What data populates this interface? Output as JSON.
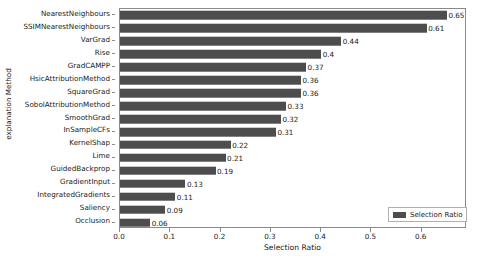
{
  "chart_data": {
    "type": "bar",
    "orientation": "horizontal",
    "title": "",
    "xlabel": "Selection Ratio",
    "ylabel": "explanation Method",
    "xlim": [
      0.0,
      0.69
    ],
    "xticks": [
      0.0,
      0.1,
      0.2,
      0.3,
      0.4,
      0.5,
      0.6
    ],
    "xtick_labels": [
      "0.0",
      "0.1",
      "0.2",
      "0.3",
      "0.4",
      "0.5",
      "0.6"
    ],
    "grid": false,
    "legend": {
      "position": "lower right",
      "entries": [
        "Selection Ratio"
      ]
    },
    "bar_color": "#4d4d4d",
    "categories": [
      "NearestNeighbours",
      "SSIMNearestNeighbours",
      "VarGrad",
      "Rise",
      "GradCAMPP",
      "HsicAttributionMethod",
      "SquareGrad",
      "SobolAttributionMethod",
      "SmoothGrad",
      "InSampleCFs",
      "KernelShap",
      "Lime",
      "GuidedBackprop",
      "GradientInput",
      "IntegratedGradients",
      "Saliency",
      "Occlusion"
    ],
    "values": [
      0.65,
      0.61,
      0.44,
      0.4,
      0.37,
      0.36,
      0.36,
      0.33,
      0.32,
      0.31,
      0.22,
      0.21,
      0.19,
      0.13,
      0.11,
      0.09,
      0.06
    ],
    "value_labels": [
      "0.65",
      "0.61",
      "0.44",
      "0.4",
      "0.37",
      "0.36",
      "0.36",
      "0.33",
      "0.32",
      "0.31",
      "0.22",
      "0.21",
      "0.19",
      "0.13",
      "0.11",
      "0.09",
      "0.06"
    ]
  }
}
